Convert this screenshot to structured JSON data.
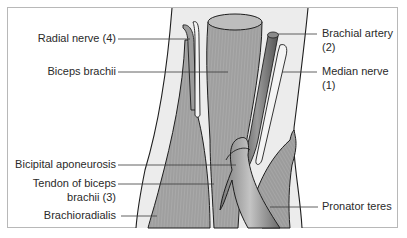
{
  "figure": {
    "title": "",
    "colors": {
      "frame_border": "#b8b8b8",
      "muscle_fill": "#a9a9a9",
      "skin_fill": "#ececec",
      "artery_fill": "#7a7a7a",
      "nerve_fill": "#f4f4f4",
      "leader_line": "#3a3a3a",
      "text": "#2a2a2a"
    }
  },
  "labels": {
    "left": [
      {
        "id": "radial-nerve",
        "text": "Radial nerve (4)"
      },
      {
        "id": "biceps-brachii",
        "text": "Biceps brachii"
      },
      {
        "id": "bicipital-aponeurosis",
        "text": "Bicipital aponeurosis"
      },
      {
        "id": "tendon-biceps",
        "line1": "Tendon of biceps",
        "line2": "brachii (3)"
      },
      {
        "id": "brachioradialis",
        "text": "Brachioradialis"
      }
    ],
    "right": [
      {
        "id": "brachial-artery",
        "line1": "Brachial artery",
        "line2": "(2)"
      },
      {
        "id": "median-nerve",
        "line1": "Median nerve",
        "line2": "(1)"
      },
      {
        "id": "pronator-teres",
        "text": "Pronator teres"
      }
    ]
  }
}
